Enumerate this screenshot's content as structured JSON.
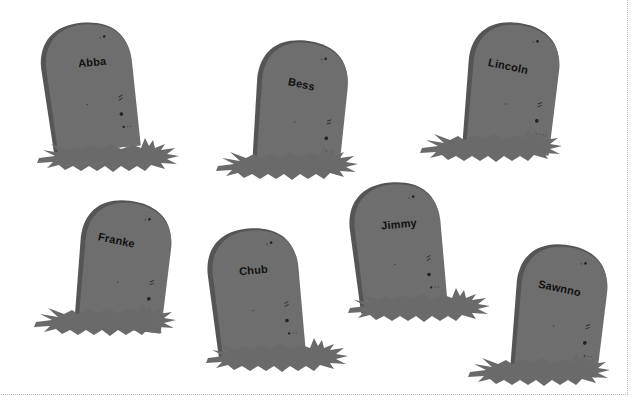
{
  "colors": {
    "background": "#ffffff",
    "stone": "#6e6e6e",
    "stone_shadow": "#555555",
    "grass": "#6a6a6a",
    "text": "#111111",
    "frame_border": "#bdbdbd"
  },
  "tombstones": [
    {
      "name": "Abba"
    },
    {
      "name": "Bess"
    },
    {
      "name": "Lincoln"
    },
    {
      "name": "Franke"
    },
    {
      "name": "Chub"
    },
    {
      "name": "Jimmy"
    },
    {
      "name": "Sawnno"
    }
  ]
}
